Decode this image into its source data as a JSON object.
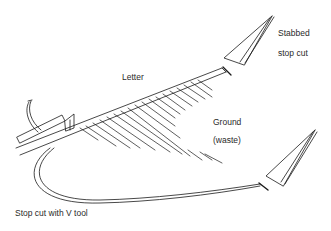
{
  "diagram": {
    "labels": {
      "letter": "Letter",
      "stabbed_line1": "Stabbed",
      "stabbed_line2": "stop cut",
      "ground_line1": "Ground",
      "ground_line2": "(waste)",
      "vtool": "Stop cut with V tool"
    },
    "colors": {
      "stroke": "#1a1a1a",
      "text": "#2a2a2a",
      "background": "#ffffff"
    }
  }
}
